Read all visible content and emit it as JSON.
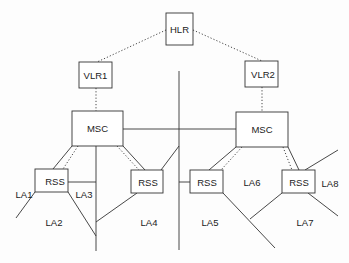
{
  "diagram": {
    "type": "GSM location architecture",
    "colors": {
      "line": "#333333",
      "box_fill": "#ffffff",
      "text": "#222222"
    },
    "nodes": {
      "hlr": {
        "label": "HLR"
      },
      "vlr1": {
        "label": "VLR1"
      },
      "vlr2": {
        "label": "VLR2"
      },
      "msc1": {
        "label": "MSC"
      },
      "msc2": {
        "label": "MSC"
      },
      "rss1": {
        "label": "RSS"
      },
      "rss2": {
        "label": "RSS"
      },
      "rss3": {
        "label": "RSS"
      },
      "rss4": {
        "label": "RSS"
      }
    },
    "areas": {
      "la1": "LA1",
      "la2": "LA2",
      "la3": "LA3",
      "la4": "LA4",
      "la5": "LA5",
      "la6": "LA6",
      "la7": "LA7",
      "la8": "LA8"
    }
  }
}
